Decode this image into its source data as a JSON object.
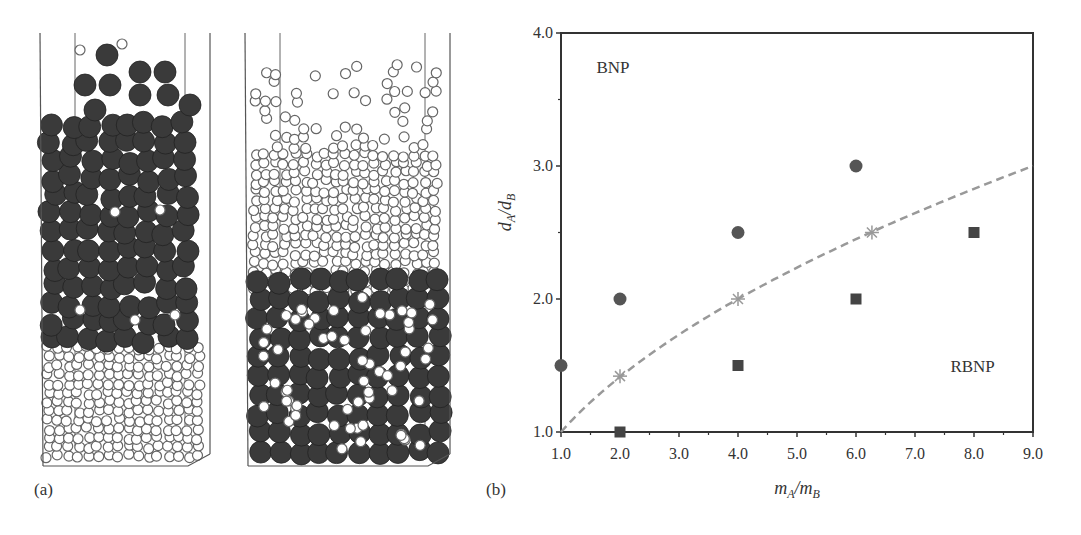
{
  "figure": {
    "panel_a_label": "(a)",
    "panel_b_label": "(b)",
    "panel_a": {
      "description": "Two DEM snapshots of binary particle beds in rectangular containers",
      "left_container": {
        "top_layer": "large dark particles",
        "bottom_layer": "small white particles",
        "pattern": "BNP"
      },
      "right_container": {
        "top_layer": "small white particles",
        "bottom_layer": "large dark particles",
        "pattern": "RBNP"
      }
    }
  },
  "chart_data": {
    "type": "scatter",
    "title": "",
    "xlabel": "m_A/m_B",
    "ylabel": "d_A/d_B",
    "xlim": [
      1.0,
      9.0
    ],
    "ylim": [
      1.0,
      4.0
    ],
    "xticks": [
      "1.0",
      "2.0",
      "3.0",
      "4.0",
      "5.0",
      "6.0",
      "7.0",
      "8.0",
      "9.0"
    ],
    "yticks": [
      "1.0",
      "2.0",
      "3.0",
      "4.0"
    ],
    "grid": false,
    "annotations": [
      {
        "text": "BNP",
        "x": 1.6,
        "y": 3.7
      },
      {
        "text": "RBNP",
        "x": 7.6,
        "y": 1.45
      }
    ],
    "series": [
      {
        "name": "BNP",
        "marker": "circle",
        "color": "#555555",
        "x": [
          1.0,
          2.0,
          4.0,
          6.0
        ],
        "y": [
          1.5,
          2.0,
          2.5,
          3.0
        ]
      },
      {
        "name": "RBNP",
        "marker": "square",
        "color": "#444444",
        "x": [
          2.0,
          4.0,
          6.0,
          8.0
        ],
        "y": [
          1.0,
          1.5,
          2.0,
          2.5
        ]
      },
      {
        "name": "Transition",
        "marker": "asterisk",
        "color": "#999999",
        "x": [
          2.0,
          4.0,
          6.27
        ],
        "y": [
          1.42,
          2.0,
          2.5
        ]
      },
      {
        "name": "Boundary",
        "style": "dashed",
        "color": "#999999",
        "x": [
          1.0,
          2.0,
          3.0,
          4.0,
          5.0,
          6.0,
          7.0,
          8.0,
          9.0
        ],
        "y": [
          1.0,
          1.414,
          1.732,
          2.0,
          2.236,
          2.449,
          2.646,
          2.828,
          3.0
        ]
      }
    ]
  }
}
